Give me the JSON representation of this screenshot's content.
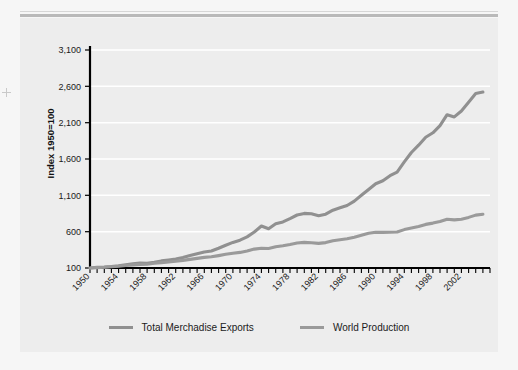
{
  "figure": {
    "background_color": "#f6f6f6",
    "panel_color": "#ededed",
    "rule_color": "#b9b9b9",
    "axis_color": "#000000",
    "gridline_color": "#ffffff"
  },
  "axis_title": "Index 1950=100",
  "legend": {
    "items": [
      {
        "label": "Total Merchadise Exports",
        "color": "#909090",
        "icon": "line-swatch-icon"
      },
      {
        "label": "World Production",
        "color": "#9a9a9a",
        "icon": "line-swatch-icon"
      }
    ]
  },
  "chart_data": {
    "type": "line",
    "title": "",
    "xlabel": "",
    "ylabel": "Index 1950=100",
    "xlim": [
      1950,
      2006
    ],
    "ylim": [
      100,
      3100
    ],
    "ytick_values": [
      100,
      600,
      1100,
      1600,
      2100,
      2600,
      3100
    ],
    "ytick_labels": [
      "100",
      "600",
      "1,100",
      "1,600",
      "2,100",
      "2,600",
      "3,100"
    ],
    "xtick_values": [
      1950,
      1954,
      1958,
      1962,
      1966,
      1970,
      1974,
      1978,
      1982,
      1986,
      1990,
      1994,
      1998,
      2002
    ],
    "xtick_labels": [
      "1950",
      "1954",
      "1958",
      "1962",
      "1966",
      "1970",
      "1974",
      "1978",
      "1982",
      "1986",
      "1990",
      "1994",
      "1998",
      "2002"
    ],
    "xtick_minor_step": 1,
    "grid": "horizontal",
    "legend_position": "bottom",
    "x": [
      1950,
      1951,
      1952,
      1953,
      1954,
      1955,
      1956,
      1957,
      1958,
      1959,
      1960,
      1961,
      1962,
      1963,
      1964,
      1965,
      1966,
      1967,
      1968,
      1969,
      1970,
      1971,
      1972,
      1973,
      1974,
      1975,
      1976,
      1977,
      1978,
      1979,
      1980,
      1981,
      1982,
      1983,
      1984,
      1985,
      1986,
      1987,
      1988,
      1989,
      1990,
      1991,
      1992,
      1993,
      1994,
      1995,
      1996,
      1997,
      1998,
      1999,
      2000,
      2001,
      2002,
      2003,
      2004,
      2005
    ],
    "series": [
      {
        "name": "Total Merchadise Exports",
        "color": "#909090",
        "values": [
          100,
          110,
          114,
          120,
          130,
          145,
          158,
          168,
          166,
          180,
          198,
          210,
          224,
          244,
          272,
          296,
          320,
          334,
          372,
          414,
          452,
          482,
          528,
          596,
          678,
          640,
          708,
          734,
          780,
          830,
          852,
          846,
          820,
          840,
          896,
          928,
          960,
          1020,
          1100,
          1180,
          1260,
          1300,
          1370,
          1420,
          1560,
          1690,
          1790,
          1900,
          1960,
          2060,
          2210,
          2180,
          2260,
          2380,
          2500,
          2520
        ]
      },
      {
        "name": "World Production",
        "color": "#9a9a9a",
        "values": [
          100,
          106,
          110,
          116,
          124,
          134,
          142,
          150,
          152,
          164,
          174,
          182,
          192,
          204,
          218,
          232,
          246,
          254,
          270,
          288,
          304,
          314,
          334,
          360,
          372,
          368,
          392,
          406,
          424,
          444,
          452,
          448,
          438,
          450,
          474,
          490,
          502,
          524,
          552,
          578,
          592,
          590,
          592,
          596,
          628,
          650,
          672,
          700,
          718,
          740,
          772,
          762,
          772,
          796,
          828,
          840
        ]
      }
    ]
  }
}
